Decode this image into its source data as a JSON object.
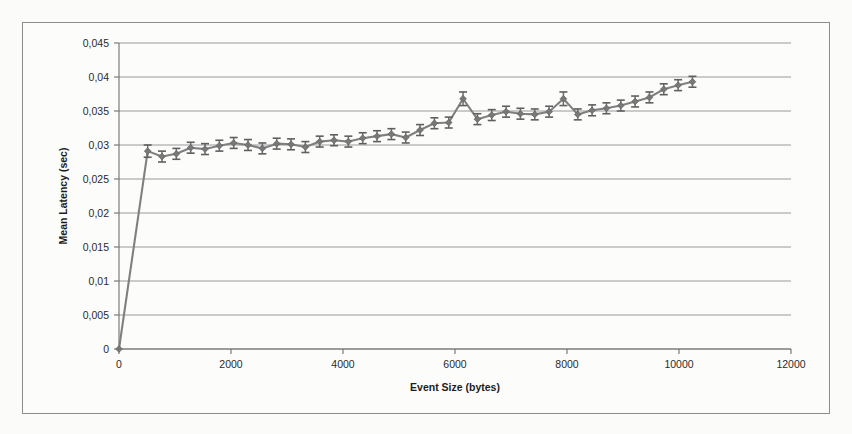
{
  "figure": {
    "background_color": "#fbfbfa",
    "frame_color": "#8d8d8d",
    "plot_background": "#fcfcfb"
  },
  "chart_data": {
    "type": "line",
    "title": "",
    "subtitle": "",
    "xlabel": "Event Size (bytes)",
    "ylabel": "Mean Latency (sec)",
    "xlim": [
      0,
      12000
    ],
    "ylim": [
      0,
      0.045
    ],
    "xticks": [
      0,
      2000,
      4000,
      6000,
      8000,
      10000,
      12000
    ],
    "xtick_labels": [
      "0",
      "2000",
      "4000",
      "6000",
      "8000",
      "10000",
      "12000"
    ],
    "yticks": [
      0,
      0.005,
      0.01,
      0.015,
      0.02,
      0.025,
      0.03,
      0.035,
      0.04,
      0.045
    ],
    "ytick_labels": [
      "0",
      "0,005",
      "0,01",
      "0,015",
      "0,02",
      "0,025",
      "0,03",
      "0,035",
      "0,04",
      "0,045"
    ],
    "decimal_separator": ",",
    "grid": {
      "horizontal": true,
      "vertical": false,
      "color": "#8e8e8e"
    },
    "legend": {
      "visible": false,
      "position": "none"
    },
    "marker": "diamond",
    "error_bars": true,
    "series": [
      {
        "name": "Mean Latency",
        "color": "#808080",
        "x": [
          0,
          512,
          768,
          1024,
          1280,
          1536,
          1792,
          2048,
          2304,
          2560,
          2816,
          3072,
          3328,
          3584,
          3840,
          4096,
          4352,
          4608,
          4864,
          5120,
          5376,
          5632,
          5888,
          6144,
          6400,
          6656,
          6912,
          7168,
          7424,
          7680,
          7936,
          8192,
          8448,
          8704,
          8960,
          9216,
          9472,
          9728,
          9984,
          10240
        ],
        "values": [
          0,
          0.0291,
          0.0283,
          0.0287,
          0.0296,
          0.0294,
          0.0299,
          0.0303,
          0.03,
          0.0295,
          0.0302,
          0.0301,
          0.0297,
          0.0305,
          0.0307,
          0.0305,
          0.031,
          0.0313,
          0.0316,
          0.0311,
          0.0322,
          0.0332,
          0.0333,
          0.0368,
          0.0338,
          0.0344,
          0.0349,
          0.0346,
          0.0345,
          0.0349,
          0.0368,
          0.0345,
          0.0351,
          0.0354,
          0.0358,
          0.0364,
          0.037,
          0.0382,
          0.0388,
          0.0393
        ],
        "errors": [
          0.0,
          0.0009,
          0.0008,
          0.0008,
          0.0008,
          0.0008,
          0.0008,
          0.0008,
          0.0008,
          0.0008,
          0.0008,
          0.0008,
          0.0008,
          0.0008,
          0.0008,
          0.0008,
          0.0008,
          0.0008,
          0.0008,
          0.0008,
          0.0008,
          0.0008,
          0.0008,
          0.001,
          0.0008,
          0.0008,
          0.0008,
          0.0008,
          0.0008,
          0.0008,
          0.001,
          0.0008,
          0.0008,
          0.0008,
          0.0008,
          0.0008,
          0.0008,
          0.0008,
          0.0008,
          0.0008
        ]
      }
    ]
  }
}
